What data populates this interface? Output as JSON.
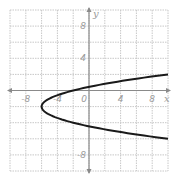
{
  "chart_data": {
    "type": "line",
    "title": "",
    "xlabel": "x",
    "ylabel": "y",
    "xlim": [
      -10,
      10
    ],
    "ylim": [
      -10,
      10
    ],
    "grid": true,
    "grid_step": 2,
    "x_ticks": [
      {
        "value": -8,
        "label": "-8"
      },
      {
        "value": -4,
        "label": "-4"
      },
      {
        "value": 0,
        "label": "0"
      },
      {
        "value": 4,
        "label": "4"
      },
      {
        "value": 8,
        "label": "8"
      }
    ],
    "y_ticks": [
      {
        "value": 8,
        "label": "8"
      },
      {
        "value": 4,
        "label": "4"
      },
      {
        "value": -8,
        "label": "-8"
      }
    ],
    "series": [
      {
        "name": "parabola x = (y+2)^2 - 6",
        "vertex": [
          -6,
          -2
        ],
        "opens": "right",
        "points": [
          [
            10,
            2
          ],
          [
            6.25,
            1.5
          ],
          [
            3,
            1
          ],
          [
            0.25,
            0.5
          ],
          [
            -2,
            0
          ],
          [
            -3.75,
            -0.5
          ],
          [
            -5,
            -1
          ],
          [
            -5.75,
            -1.5
          ],
          [
            -6,
            -2
          ],
          [
            -5.75,
            -2.5
          ],
          [
            -5,
            -3
          ],
          [
            -3.75,
            -3.5
          ],
          [
            -2,
            -4
          ],
          [
            0.25,
            -4.5
          ],
          [
            3,
            -5
          ],
          [
            6.25,
            -5.5
          ],
          [
            10,
            -6
          ]
        ],
        "color": "#1a1a1a"
      }
    ],
    "colors": {
      "grid": "#c8c8c8",
      "axis": "#8a8a8a",
      "curve": "#1a1a1a",
      "labels": "#9a9a9a"
    }
  }
}
